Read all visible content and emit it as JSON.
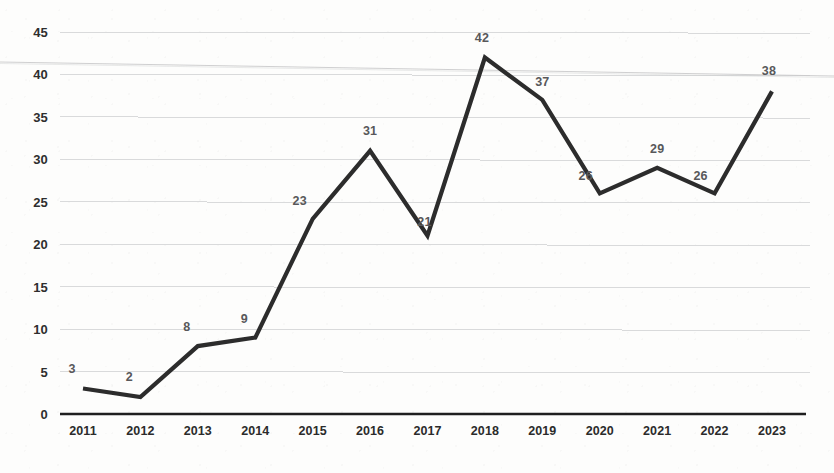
{
  "chart_data": {
    "type": "line",
    "title": "",
    "subtitle": "",
    "xlabel": "",
    "ylabel": "",
    "categories": [
      "2011",
      "2012",
      "2013",
      "2014",
      "2015",
      "2016",
      "2017",
      "2018",
      "2019",
      "2020",
      "2021",
      "2022",
      "2023"
    ],
    "values": [
      3,
      2,
      8,
      9,
      23,
      31,
      21,
      42,
      37,
      26,
      29,
      26,
      38
    ],
    "data_labels": [
      "3",
      "2",
      "8",
      "9",
      "23",
      "31",
      "21",
      "42",
      "37",
      "26",
      "29",
      "26",
      "38"
    ],
    "series": [
      {
        "name": "",
        "values": [
          3,
          2,
          8,
          9,
          23,
          31,
          21,
          42,
          37,
          26,
          29,
          26,
          38
        ]
      }
    ],
    "ylim": [
      0,
      45
    ],
    "ytick_values": [
      0,
      5,
      10,
      15,
      20,
      25,
      30,
      35,
      40,
      45
    ],
    "ytick_labels": [
      "0",
      "5",
      "10",
      "15",
      "20",
      "25",
      "30",
      "35",
      "40",
      "45"
    ],
    "grid": true,
    "grid_axis": "y",
    "legend": false,
    "legend_position": "none",
    "annotations": [],
    "colors": {
      "line": "#2c2c2c",
      "gridline": "#d9dadb",
      "axis": "#1f1f1f",
      "data_label": "#58585a",
      "tick_label": "#2b2b2b",
      "background": "#fdfdfc"
    }
  }
}
